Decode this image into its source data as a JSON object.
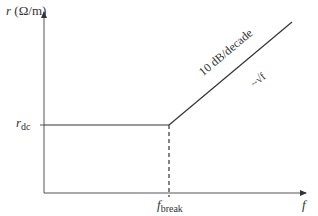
{
  "diagram": {
    "type": "bode-style asymptotic plot",
    "y_axis": {
      "symbol": "r",
      "unit": "(Ω/m)"
    },
    "x_axis": {
      "symbol": "f"
    },
    "levels": {
      "r_dc_symbol": "r",
      "r_dc_sub": "dc"
    },
    "break_point": {
      "symbol": "f",
      "sub": "break"
    },
    "slope_label": "10 dB/decade",
    "proportionality_label": "~√f",
    "colors": {
      "line": "#333333",
      "axis": "#555555"
    }
  }
}
